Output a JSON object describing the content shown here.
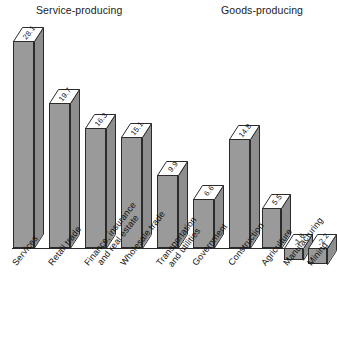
{
  "groups": {
    "service": "Service-producing",
    "goods": "Goods-producing"
  },
  "chart_data": {
    "type": "bar",
    "title": "",
    "subtitle": "",
    "xlabel": "",
    "ylabel": "",
    "grid": false,
    "legend_position": "none",
    "style": "3d-bar",
    "ylim": [
      -4,
      30
    ],
    "baseline": 0,
    "group_labels": [
      "Service-producing",
      "Goods-producing"
    ],
    "categories": [
      "Services",
      "Retail trade",
      "Finance, insurance\nand real estate",
      "Wholesale trade",
      "Transportation\nand utilities",
      "Government",
      "Construction",
      "Agriculture",
      "Manufacturing",
      "Mining"
    ],
    "values": [
      28.1,
      19.7,
      16.3,
      15.1,
      9.9,
      6.6,
      14.8,
      5.5,
      -1.6,
      -2.2
    ],
    "groups_assignment": [
      "Service-producing",
      "Service-producing",
      "Service-producing",
      "Service-producing",
      "Service-producing",
      "Service-producing",
      "Goods-producing",
      "Goods-producing",
      "Goods-producing",
      "Goods-producing"
    ],
    "value_labels": [
      "28.1",
      "19.7",
      "16.3",
      "15.1",
      "9.9",
      "6.6",
      "14.8",
      "5.5",
      "-1.6",
      "-2.2"
    ],
    "colors": {
      "bar_front": "#9a9a9a",
      "bar_side": "#8e8e8e",
      "bar_top": "#ffffff",
      "outline": "#2b2b2b",
      "text": "#111111",
      "background": "#ffffff"
    }
  },
  "bars": [
    {
      "label": "Services",
      "value": "28.1",
      "cat": "Services"
    },
    {
      "label": "Retail trade",
      "value": "19.7",
      "cat": "Retail trade"
    },
    {
      "label": "Finance, insurance and real estate",
      "value": "16.3",
      "cat_line1": "Finance, insurance",
      "cat_line2": "and real estate"
    },
    {
      "label": "Wholesale trade",
      "value": "16.1",
      "cat": "Wholesale trade"
    },
    {
      "label": "Transportation and utilities",
      "value": "9.9",
      "cat_line1": "Transportation",
      "cat_line2": "and utilities"
    },
    {
      "label": "Government",
      "value": "6.6",
      "cat": "Government"
    },
    {
      "label": "Construction",
      "value": "14.8",
      "cat": "Construction"
    },
    {
      "label": "Agriculture",
      "value": "5.5",
      "cat": "Agriculture"
    },
    {
      "label": "Manufacturing",
      "value": "-1.6",
      "cat": "Manufacturing"
    },
    {
      "label": "Mining",
      "value": "-2.2",
      "cat": "Mining"
    }
  ],
  "bar_values": {
    "b0": "28.1",
    "b1": "19.7",
    "b2": "16.3",
    "b3": "15.1",
    "b4": "9.9",
    "b5": "6.6",
    "b6": "14.8",
    "b7": "5.5",
    "b8": "-1.6",
    "b9": "-2.2"
  },
  "cat_labels": {
    "c0": "Services",
    "c1": "Retail trade",
    "c2a": "Finance, insurance",
    "c2b": "and real estate",
    "c3": "Wholesale trade",
    "c4a": "Transportation",
    "c4b": "and utilities",
    "c5": "Government",
    "c6": "Construction",
    "c7": "Agriculture",
    "c8": "Manufacturing",
    "c9": "Mining"
  }
}
